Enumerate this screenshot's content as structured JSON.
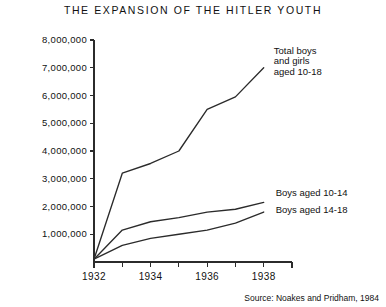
{
  "chart_data": {
    "type": "line",
    "title": "THE EXPANSION OF THE HITLER YOUTH",
    "xlabel": "",
    "ylabel": "",
    "x": [
      1932,
      1933,
      1934,
      1935,
      1936,
      1937,
      1938,
      1939
    ],
    "xlim": [
      1932,
      1939
    ],
    "ylim": [
      0,
      8000000
    ],
    "grid": false,
    "legend_position": "inline-right",
    "xtick_labels": [
      "1932",
      "",
      "1934",
      "",
      "1936",
      "",
      "1938",
      ""
    ],
    "ytick_labels": [
      "1,000,000",
      "2,000,000",
      "3,000,000",
      "4,000,000",
      "5,000,000",
      "6,000,000",
      "7,000,000",
      "8,000,000"
    ],
    "ytick_values": [
      1000000,
      2000000,
      3000000,
      4000000,
      5000000,
      6000000,
      7000000,
      8000000
    ],
    "series": [
      {
        "name": "Total boys and girls aged 10-18",
        "label_lines": [
          "Total boys",
          "and girls",
          "aged 10-18"
        ],
        "x": [
          1932,
          1933,
          1934,
          1935,
          1936,
          1937,
          1938
        ],
        "values": [
          100000,
          3200000,
          3550000,
          4000000,
          5500000,
          5950000,
          7000000
        ]
      },
      {
        "name": "Boys aged 10-14",
        "label_lines": [
          "Boys aged 10-14"
        ],
        "x": [
          1932,
          1933,
          1934,
          1935,
          1936,
          1937,
          1938
        ],
        "values": [
          100000,
          1150000,
          1450000,
          1600000,
          1800000,
          1900000,
          2150000
        ]
      },
      {
        "name": "Boys aged 14-18",
        "label_lines": [
          "Boys aged 14-18"
        ],
        "x": [
          1932,
          1933,
          1934,
          1935,
          1936,
          1937,
          1938
        ],
        "values": [
          100000,
          600000,
          850000,
          1000000,
          1150000,
          1400000,
          1800000
        ]
      }
    ],
    "annotations": [],
    "source": "Source: Noakes and Pridham, 1984",
    "line_color": "#2b2b2b",
    "axis_color": "#2b2b2b",
    "background": "#ffffff"
  }
}
